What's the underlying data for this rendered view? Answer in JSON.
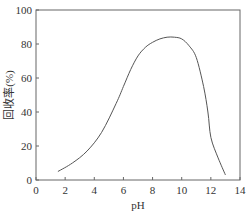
{
  "chart_data": {
    "type": "line",
    "title": "",
    "xlabel": "pH",
    "ylabel": "回收率(%)",
    "xlim": [
      0,
      14
    ],
    "ylim": [
      0,
      100
    ],
    "x_ticks": [
      0,
      2,
      4,
      6,
      8,
      10,
      12,
      14
    ],
    "y_ticks": [
      0,
      20,
      40,
      60,
      80,
      100
    ],
    "grid": false,
    "legend": null,
    "series": [
      {
        "name": "回收率",
        "x": [
          1.5,
          2.5,
          3.5,
          4.5,
          5.5,
          6.0,
          6.5,
          7.0,
          7.5,
          8.0,
          8.5,
          9.0,
          9.5,
          10.0,
          10.5,
          11.0,
          11.5,
          11.8,
          12.0,
          12.5,
          13.0
        ],
        "y": [
          5,
          10,
          17,
          28,
          45,
          55,
          65,
          73,
          78,
          81,
          83,
          84,
          84,
          83,
          79,
          72,
          55,
          40,
          25,
          13,
          3
        ]
      }
    ],
    "colors": {
      "line": "#555555",
      "axis": "#666666"
    }
  }
}
